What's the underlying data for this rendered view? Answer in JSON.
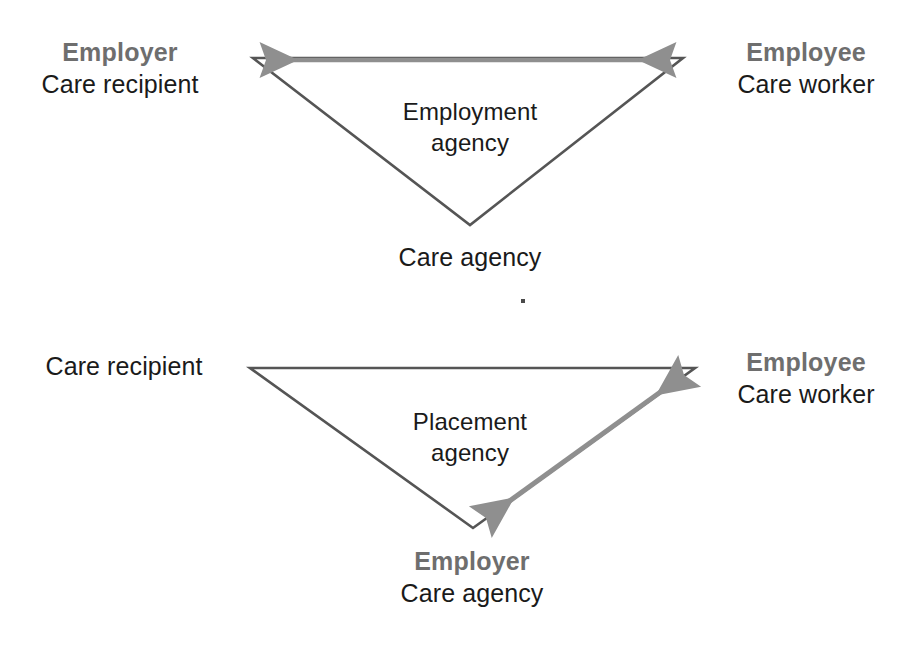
{
  "figure": {
    "type": "relationship-diagram",
    "background_color": "#ffffff",
    "line_color": "#555555",
    "arrow_color": "#8c8c8c",
    "role_text_color": "#6e6e6e",
    "person_text_color": "#1a1a1a"
  },
  "diagrams": [
    {
      "id": "employment-agency",
      "center_label": {
        "line1": "Employment",
        "line2": "agency"
      },
      "left_node": {
        "role": "Employer",
        "person": "Care recipient"
      },
      "right_node": {
        "role": "Employee",
        "person": "Care worker"
      },
      "apex_node": {
        "role": "",
        "person": "Care agency"
      },
      "relationship_arrow": {
        "from": "Employer",
        "to": "Employee",
        "direction": "double",
        "edge": "top"
      }
    },
    {
      "id": "placement-agency",
      "center_label": {
        "line1": "Placement",
        "line2": "agency"
      },
      "left_node": {
        "role": "",
        "person": "Care recipient"
      },
      "right_node": {
        "role": "Employee",
        "person": "Care worker"
      },
      "apex_node": {
        "role": "Employer",
        "person": "Care agency"
      },
      "relationship_arrow": {
        "from": "Care agency",
        "to": "Employee",
        "direction": "double",
        "edge": "right-leg"
      }
    }
  ]
}
